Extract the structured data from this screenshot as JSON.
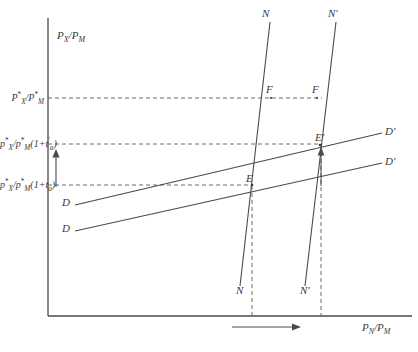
{
  "figure": {
    "type": "economic-diagram",
    "background_color": "#ffffff",
    "line_color": "#3a3a3a"
  },
  "axes": {
    "y_label": {
      "base": "P",
      "sub": "X",
      "slash": "/",
      "base2": "P",
      "sub2": "M"
    },
    "y_label_text": "PX/PM",
    "x_label": {
      "base": "P",
      "sub": "N",
      "slash": "/",
      "base2": "P",
      "sub2": "M"
    },
    "x_label_text": "PN/PM",
    "origin_x": 48,
    "origin_y": 316,
    "x_axis_end": 412,
    "y_axis_top": 18
  },
  "ticks": {
    "world_price": {
      "label_text": "P*X/P*M",
      "p": "P",
      "star": "*",
      "x": "X",
      "slash": "/",
      "p2": "P",
      "star2": "*",
      "m": "M",
      "y": 98
    },
    "tariff_high": {
      "label_text": "p*X/p*M(1+t'a)",
      "p": "p",
      "star": "*",
      "x": "X",
      "slash": "/",
      "p2": "p",
      "star2": "*",
      "m": "M",
      "paren_open": "(1+",
      "t": "t",
      "prime": "'",
      "a": "a",
      "paren_close": ")",
      "y": 144
    },
    "tariff_low": {
      "label_text": "p*X/p*M(1+ta)",
      "p": "p",
      "star": "*",
      "x": "X",
      "slash": "/",
      "p2": "p",
      "star2": "*",
      "m": "M",
      "paren_open": "(1+",
      "t": "t",
      "a": "a",
      "paren_close": ")",
      "y": 185
    }
  },
  "curves": {
    "supply_n": {
      "label_top": "N",
      "label_bottom": "N",
      "label_top_x": 262,
      "label_top_y": 14,
      "label_bottom_x": 236,
      "label_bottom_y": 291
    },
    "supply_n_prime": {
      "label_top": "N'",
      "label_bottom": "N'",
      "label_top_x": 328,
      "label_top_y": 14,
      "label_bottom_x": 300,
      "label_bottom_y": 291
    },
    "demand_d_upper": {
      "label_left": "D",
      "label_right": "D'",
      "label_left_x": 62,
      "label_left_y": 203,
      "label_right_x": 385,
      "label_right_y": 131
    },
    "demand_d_lower": {
      "label_left": "D",
      "label_right": "D'",
      "label_left_x": 62,
      "label_left_y": 229,
      "label_right_x": 385,
      "label_right_y": 161
    }
  },
  "points": [
    {
      "name": "F",
      "label": "F",
      "x": 270,
      "y": 91,
      "px": 278,
      "py": 98
    },
    {
      "name": "F2",
      "label": "F",
      "x": 316,
      "y": 91,
      "px": 324,
      "py": 98
    },
    {
      "name": "E-prime",
      "label": "E'",
      "x": 318,
      "y": 140,
      "px": 321,
      "py": 145
    },
    {
      "name": "E",
      "label": "E",
      "x": 250,
      "y": 181,
      "px": 254,
      "py": 186
    }
  ],
  "arrows": {
    "vertical_shift": {
      "x": 56,
      "y_from": 186,
      "y_to": 152,
      "direction": "up"
    },
    "equilibrium_shift": {
      "x": 252,
      "y_from": 185,
      "y_to": 150,
      "direction": "up"
    },
    "horizontal_shift": {
      "x_from": 232,
      "x_to": 300,
      "y": 327,
      "direction": "right"
    }
  },
  "dashed_guides": {
    "horizontal": [
      98,
      144,
      185
    ],
    "vertical": [
      {
        "x": 252,
        "y_from": 186,
        "y_to": 316
      },
      {
        "x": 321,
        "y_from": 145,
        "y_to": 316
      }
    ]
  }
}
